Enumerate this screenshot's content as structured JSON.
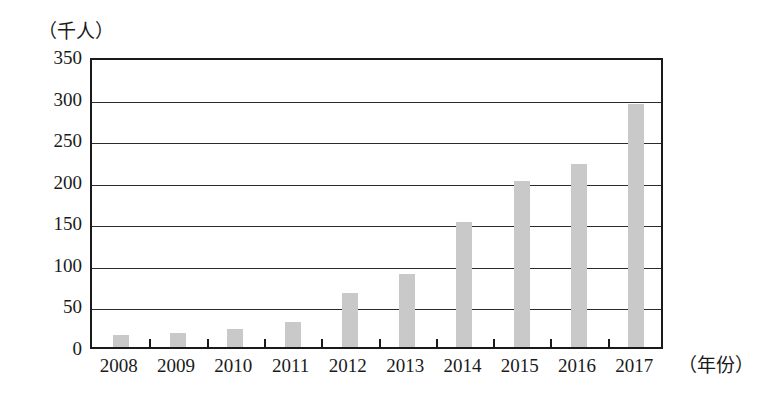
{
  "chart_data": {
    "type": "bar",
    "title": "",
    "subtitle": "",
    "categories": [
      "2008",
      "2009",
      "2010",
      "2011",
      "2012",
      "2013",
      "2014",
      "2015",
      "2016",
      "2017"
    ],
    "values": [
      15,
      17,
      22,
      30,
      65,
      88,
      150,
      200,
      220,
      292
    ],
    "xlabel": "（年份）",
    "ylabel": "（千人）",
    "ylim": [
      0,
      350
    ],
    "yticks": [
      0,
      50,
      100,
      150,
      200,
      250,
      300,
      350
    ],
    "ytick_labels": [
      "0",
      "50",
      "100",
      "150",
      "200",
      "250",
      "300",
      "350"
    ],
    "grid": true,
    "legend": false,
    "legend_position": "none",
    "bar_color": "#c9c9c9",
    "axis_color": "#1a1a1a",
    "background_color": "#ffffff",
    "annotations": []
  }
}
